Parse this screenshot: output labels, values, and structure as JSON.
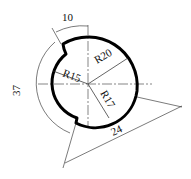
{
  "drawing": {
    "type": "cam profile / technical drawing",
    "dimensions": {
      "r_outer": "R20",
      "r_inner": "R15",
      "r_mid": "R17",
      "arc_top": "10",
      "arc_left": "37",
      "arc_bottom_right": "24"
    }
  },
  "colors": {
    "profile": "#000000",
    "dim_line": "#222222",
    "background": "#ffffff"
  }
}
